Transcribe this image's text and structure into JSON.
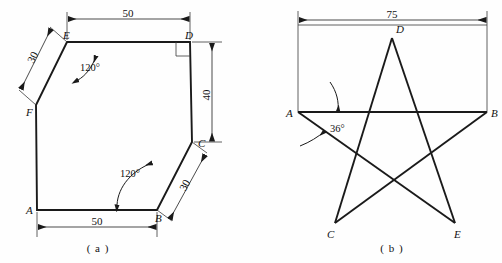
{
  "page": {
    "background_color": "#fefefe",
    "line_color": "#1a1a1a",
    "thin_line_color": "#3a3a3a",
    "width": 502,
    "height": 263
  },
  "figures": [
    {
      "caption": "( a )",
      "name": "hexagon-outline-figure",
      "shape_type": "irregular-hexagon",
      "vertices": [
        {
          "label": "A",
          "x": 37,
          "y": 210
        },
        {
          "label": "B",
          "x": 157,
          "y": 210
        },
        {
          "label": "C",
          "x": 192,
          "y": 142
        },
        {
          "label": "D",
          "x": 190,
          "y": 42
        },
        {
          "label": "E",
          "x": 67,
          "y": 42
        },
        {
          "label": "F",
          "x": 36,
          "y": 105
        }
      ],
      "dimensions": [
        {
          "name": "top-width",
          "value": "50",
          "from": "E",
          "to": "D"
        },
        {
          "name": "bottom-width",
          "value": "50",
          "from": "A",
          "to": "B"
        },
        {
          "name": "right-height",
          "value": "40",
          "from": "D",
          "to": "C"
        },
        {
          "name": "upper-left-edge",
          "value": "30",
          "from": "E",
          "to": "F"
        },
        {
          "name": "lower-right-edge",
          "value": "30",
          "from": "B",
          "to": "C"
        }
      ],
      "angles": [
        {
          "name": "angle-at-E",
          "value": "120°"
        },
        {
          "name": "angle-at-B",
          "value": "120°"
        }
      ],
      "right_angle_marks": [
        {
          "name": "right-angle-at-D",
          "at": "D"
        }
      ]
    },
    {
      "caption": "( b )",
      "name": "five-pointed-star-figure",
      "shape_type": "pentagram",
      "vertices": [
        {
          "label": "A",
          "x": 298,
          "y": 112
        },
        {
          "label": "B",
          "x": 487,
          "y": 112
        },
        {
          "label": "C",
          "x": 335,
          "y": 223
        },
        {
          "label": "D",
          "x": 392,
          "y": 38
        },
        {
          "label": "E",
          "x": 455,
          "y": 223
        }
      ],
      "dimensions": [
        {
          "name": "overall-width",
          "value": "75",
          "from": "A",
          "to": "B"
        }
      ],
      "angles": [
        {
          "name": "angle-at-A",
          "value": "36°"
        }
      ],
      "construction_box": {
        "name": "construction-rectangle",
        "left": 298,
        "right": 487,
        "top": 25,
        "bottom": 112
      }
    }
  ]
}
